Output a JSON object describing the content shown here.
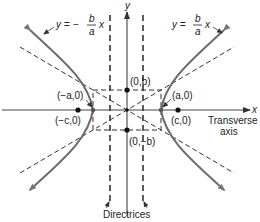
{
  "figure": {
    "type": "hyperbola-diagram",
    "axis_labels": {
      "x": "x",
      "y": "y"
    },
    "asymptote_labels": {
      "negative": {
        "prefix": "y = −",
        "num": "b",
        "den": "a",
        "suffix": "x"
      },
      "positive": {
        "prefix": "y =",
        "num": "b",
        "den": "a",
        "suffix": "x"
      }
    },
    "points": {
      "neg_vertex": "(−a,0)",
      "pos_vertex": "(a,0)",
      "neg_focus": "(−c,0)",
      "pos_focus": "(c,0)",
      "top_co_vertex": "(0,b)",
      "bottom_co_vertex": "(0,−b)"
    },
    "transverse_axis_label": [
      "Transverse",
      "axis"
    ],
    "directrices_label": "Directrices",
    "colors": {
      "curve": "#6b6b6b",
      "lines": "#333333"
    }
  }
}
